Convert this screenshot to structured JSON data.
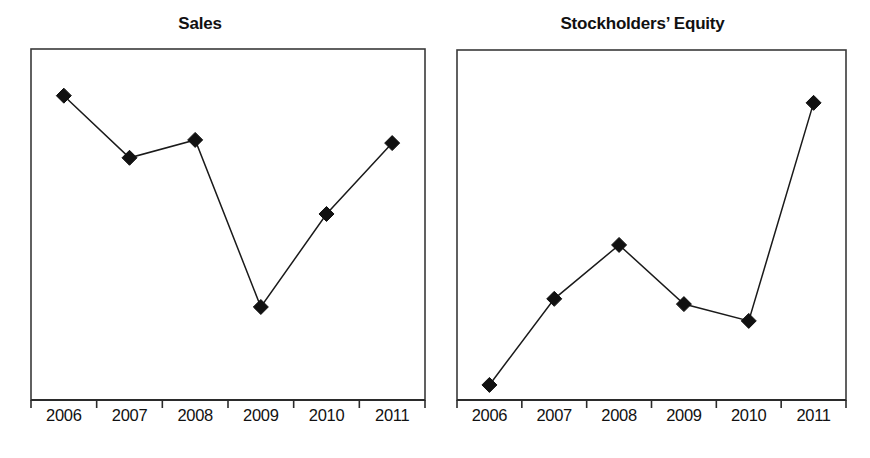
{
  "figure": {
    "background_color": "#ffffff",
    "line_color": "#1a1a1a",
    "marker_color": "#111111",
    "frame_color": "#3a3a3a"
  },
  "panels": [
    {
      "id": "sales",
      "title": "Sales"
    },
    {
      "id": "equity",
      "title": "Stockholders’ Equity"
    }
  ],
  "chart_data": [
    {
      "type": "line",
      "title": "Sales",
      "xlabel": "",
      "ylabel": "",
      "categories": [
        "2006",
        "2007",
        "2008",
        "2009",
        "2010",
        "2011"
      ],
      "values": [
        0.867,
        0.69,
        0.741,
        0.265,
        0.53,
        0.732
      ],
      "value_note": "Relative plot height (0 = axis bottom, 1 = frame top); no y-axis scale is printed on the figure.",
      "ylim": [
        0,
        1
      ],
      "grid": false,
      "legend": "none",
      "marker": "filled-diamond",
      "series": [
        {
          "name": "Sales",
          "values": [
            0.867,
            0.69,
            0.741,
            0.265,
            0.53,
            0.732
          ]
        }
      ]
    },
    {
      "type": "line",
      "title": "Stockholders’ Equity",
      "xlabel": "",
      "ylabel": "",
      "categories": [
        "2006",
        "2007",
        "2008",
        "2009",
        "2010",
        "2011"
      ],
      "values": [
        0.043,
        0.289,
        0.443,
        0.274,
        0.226,
        0.849
      ],
      "value_note": "Relative plot height (0 = axis bottom, 1 = frame top); no y-axis scale is printed on the figure.",
      "ylim": [
        0,
        1
      ],
      "grid": false,
      "legend": "none",
      "marker": "filled-diamond",
      "series": [
        {
          "name": "Stockholders’ Equity",
          "values": [
            0.043,
            0.289,
            0.443,
            0.274,
            0.226,
            0.849
          ]
        }
      ]
    }
  ],
  "axis": {
    "sales": {
      "tick_labels": [
        "2006",
        "2007",
        "2008",
        "2009",
        "2010",
        "2011"
      ]
    },
    "equity": {
      "tick_labels": [
        "2006",
        "2007",
        "2008",
        "2009",
        "2010",
        "2011"
      ]
    }
  }
}
